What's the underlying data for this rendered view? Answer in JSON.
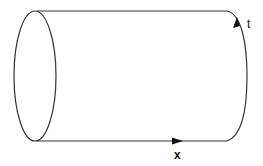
{
  "diagram": {
    "title": "",
    "shape": "cylinder",
    "labels": {
      "t_axis": "t",
      "x_axis": "x"
    },
    "colors": {
      "stroke": "#333333",
      "background": "#ffffff",
      "text": "#111111"
    }
  }
}
